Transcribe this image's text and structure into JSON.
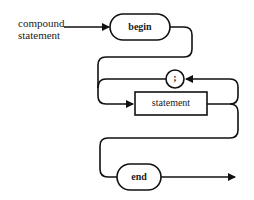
{
  "diagram": {
    "type": "syntax-diagram",
    "entry_label_line1": "compound",
    "entry_label_line2": "statement",
    "nodes": {
      "begin": {
        "label": "begin",
        "kind": "terminal-keyword"
      },
      "separator": {
        "label": ";",
        "kind": "terminal-symbol"
      },
      "statement": {
        "label": "statement",
        "kind": "nonterminal"
      },
      "end": {
        "label": "end",
        "kind": "terminal-keyword"
      }
    },
    "colors": {
      "stroke": "#111111",
      "background": "#ffffff"
    }
  }
}
